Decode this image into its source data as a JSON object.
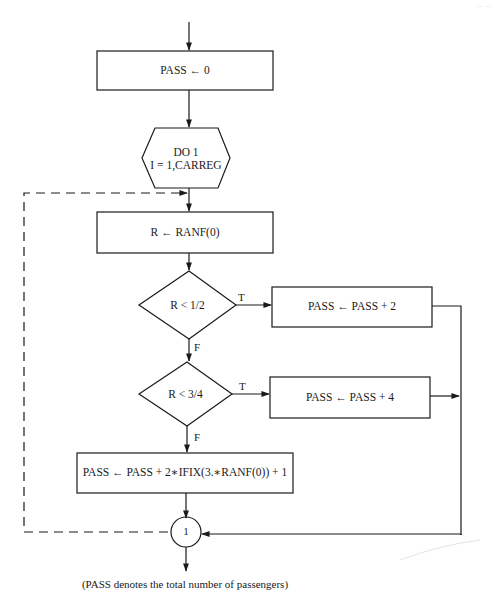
{
  "page": {
    "header_fragment": "... ...",
    "caption": "(PASS denotes the total number of passengers)"
  },
  "flowchart": {
    "nodes": {
      "init": "PASS ← 0",
      "loop_line1": "DO 1",
      "loop_line2": "I = 1,CARREG",
      "random": "R ← RANF(0)",
      "decision1": "R < 1/2",
      "add2": "PASS ← PASS + 2",
      "decision2": "R < 3/4",
      "add4": "PASS ← PASS + 4",
      "add_random": "PASS ← PASS + 2∗IFIX(3.∗RANF(0)) + 1",
      "connector": "1"
    },
    "edge_labels": {
      "d1_true": "T",
      "d1_false": "F",
      "d2_true": "T",
      "d2_false": "F"
    }
  },
  "colors": {
    "line": "#1a1a1a",
    "background": "#ffffff"
  }
}
